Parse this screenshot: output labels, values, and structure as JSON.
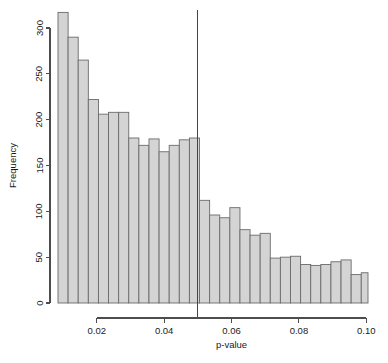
{
  "chart_data": {
    "type": "bar",
    "title": "",
    "subtitle": "",
    "xlabel": "p-value",
    "ylabel": "Frequency",
    "xlim": [
      0.0085,
      0.1005
    ],
    "ylim": [
      0,
      320
    ],
    "grid": false,
    "legend": null,
    "bin_width": 0.003,
    "x_tick_labels": [
      "0.02",
      "0.04",
      "0.06",
      "0.08",
      "0.10"
    ],
    "x_tick_values": [
      0.02,
      0.04,
      0.06,
      0.08,
      0.1
    ],
    "y_tick_labels": [
      "0",
      "50",
      "100",
      "150",
      "200",
      "250",
      "300"
    ],
    "y_tick_values": [
      0,
      50,
      100,
      150,
      200,
      250,
      300
    ],
    "bin_edges": [
      0.0085,
      0.0115,
      0.0145,
      0.0175,
      0.0205,
      0.0235,
      0.0265,
      0.0295,
      0.0325,
      0.0355,
      0.0385,
      0.0415,
      0.0445,
      0.0475,
      0.0505,
      0.0535,
      0.0565,
      0.0595,
      0.0625,
      0.0655,
      0.0685,
      0.0715,
      0.0745,
      0.0775,
      0.0805,
      0.0835,
      0.0865,
      0.0895,
      0.0925,
      0.0955,
      0.0985,
      0.1005
    ],
    "categories": [
      "0.010",
      "0.013",
      "0.016",
      "0.019",
      "0.022",
      "0.025",
      "0.028",
      "0.031",
      "0.034",
      "0.037",
      "0.040",
      "0.043",
      "0.046",
      "0.049",
      "0.052",
      "0.055",
      "0.058",
      "0.061",
      "0.064",
      "0.067",
      "0.070",
      "0.073",
      "0.076",
      "0.079",
      "0.082",
      "0.085",
      "0.088",
      "0.091",
      "0.094",
      "0.097",
      "0.100"
    ],
    "values": [
      317,
      290,
      265,
      222,
      206,
      208,
      208,
      180,
      172,
      179,
      165,
      172,
      178,
      180,
      112,
      96,
      93,
      104,
      80,
      74,
      76,
      49,
      50,
      51,
      42,
      41,
      42,
      45,
      47,
      31,
      33
    ],
    "annotations": [
      {
        "name": "significance-threshold-line",
        "type": "vline",
        "x": 0.05,
        "label": ""
      }
    ]
  },
  "figure": {
    "background_color": "#ffffff",
    "bar_fill_color": "#d4d4d4",
    "bar_edge_color": "#6b6b6b",
    "axis_color": "#4d4d4d",
    "vline_color": "#454545"
  }
}
